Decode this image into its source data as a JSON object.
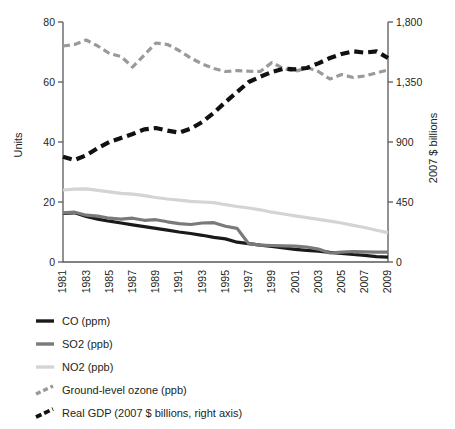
{
  "chart_data": {
    "type": "line",
    "title": "",
    "subtitle": "",
    "xlabel": "",
    "ylabel": "Units",
    "y2label": "2007 $ billions",
    "grid": false,
    "legend_position": "bottom-left",
    "xlim": [
      1981,
      2009
    ],
    "ylim": [
      0,
      80
    ],
    "y2lim": [
      0,
      1800
    ],
    "yticks": [
      "0",
      "20",
      "40",
      "60",
      "80"
    ],
    "ytick_values": [
      0,
      20,
      40,
      60,
      80
    ],
    "y2ticks": [
      "0",
      "450",
      "900",
      "1,350",
      "1,800"
    ],
    "y2tick_values": [
      0,
      450,
      900,
      1350,
      1800
    ],
    "x": [
      1981,
      1982,
      1983,
      1984,
      1985,
      1986,
      1987,
      1988,
      1989,
      1990,
      1991,
      1992,
      1993,
      1994,
      1995,
      1996,
      1997,
      1998,
      1999,
      2000,
      2001,
      2002,
      2003,
      2004,
      2005,
      2006,
      2007,
      2008,
      2009
    ],
    "xticks": [
      "1981",
      "1983",
      "1985",
      "1987",
      "1989",
      "1991",
      "1993",
      "1995",
      "1997",
      "1999",
      "2001",
      "2003",
      "2005",
      "2007",
      "2009"
    ],
    "xtick_values": [
      1981,
      1983,
      1985,
      1987,
      1989,
      1991,
      1993,
      1995,
      1997,
      1999,
      2001,
      2003,
      2005,
      2007,
      2009
    ],
    "series": [
      {
        "name": "CO (ppm)",
        "axis": "left",
        "color": "#1a1a1a",
        "width": 3.2,
        "dash": "none",
        "values": [
          16.2,
          16.4,
          15.2,
          14.3,
          13.6,
          13.0,
          12.4,
          11.8,
          11.2,
          10.6,
          10.0,
          9.5,
          8.9,
          8.2,
          7.7,
          6.6,
          6.1,
          5.6,
          5.2,
          4.7,
          4.2,
          3.9,
          3.6,
          3.2,
          2.9,
          2.5,
          2.2,
          1.8,
          1.6
        ]
      },
      {
        "name": "SO2 (ppb)",
        "axis": "left",
        "color": "#7a7a7a",
        "width": 3.2,
        "dash": "none",
        "values": [
          16.4,
          16.6,
          15.6,
          15.3,
          14.6,
          14.3,
          14.6,
          13.9,
          14.1,
          13.4,
          12.8,
          12.5,
          13.0,
          13.1,
          11.9,
          11.2,
          6.1,
          5.6,
          5.5,
          5.4,
          5.3,
          5.0,
          4.3,
          3.0,
          3.3,
          3.5,
          3.4,
          3.3,
          3.3
        ]
      },
      {
        "name": "NO2 (ppb)",
        "axis": "left",
        "color": "#d4d4d4",
        "width": 3.2,
        "dash": "none",
        "values": [
          24.0,
          24.3,
          24.4,
          23.9,
          23.4,
          22.9,
          22.6,
          22.1,
          21.5,
          21.0,
          20.6,
          20.2,
          20.0,
          19.8,
          19.1,
          18.5,
          18.0,
          17.4,
          16.6,
          16.0,
          15.4,
          14.8,
          14.2,
          13.6,
          13.0,
          12.2,
          11.5,
          10.6,
          9.8
        ]
      },
      {
        "name": "Ground-level ozone (ppb)",
        "axis": "left",
        "color": "#9a9a9a",
        "width": 3.2,
        "dash": "7,4",
        "values": [
          72.0,
          72.5,
          74.0,
          72.0,
          69.5,
          68.5,
          65.0,
          69.0,
          73.0,
          72.5,
          70.5,
          68.0,
          66.0,
          64.5,
          63.5,
          63.8,
          63.6,
          63.5,
          66.5,
          64.5,
          63.5,
          64.8,
          63.5,
          61.0,
          62.5,
          61.5,
          62.0,
          63.0,
          64.0
        ]
      },
      {
        "name": "Real GDP (2007 $ billions, right axis)",
        "axis": "right",
        "color": "#111111",
        "width": 4.2,
        "dash": "9,5",
        "values": [
          790,
          765,
          800,
          855,
          900,
          930,
          960,
          995,
          1005,
          985,
          970,
          1000,
          1050,
          1120,
          1200,
          1275,
          1350,
          1390,
          1425,
          1450,
          1445,
          1455,
          1490,
          1530,
          1560,
          1580,
          1570,
          1580,
          1530
        ]
      }
    ]
  },
  "legend": {
    "items": [
      {
        "label": "CO (ppm)",
        "swatch": "solid-black"
      },
      {
        "label": "SO2 (ppb)",
        "swatch": "solid-gray"
      },
      {
        "label": "NO2 (ppb)",
        "swatch": "solid-light-gray"
      },
      {
        "label": "Ground-level ozone (ppb)",
        "swatch": "dashed-gray"
      },
      {
        "label": "Real GDP (2007 $ billions, right axis)",
        "swatch": "dashed-black"
      }
    ]
  },
  "colors": {
    "co": "#1a1a1a",
    "so2": "#7a7a7a",
    "no2": "#d4d4d4",
    "ozone": "#9a9a9a",
    "gdp": "#111111",
    "axis": "#58585b",
    "text": "#231f20",
    "background": "#ffffff"
  }
}
